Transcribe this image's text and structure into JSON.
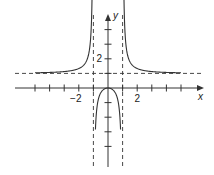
{
  "chart_data": {
    "type": "line",
    "title": "",
    "function": "y = x^2 / (x^2 - 1)",
    "xlabel": "x",
    "ylabel": "y",
    "x_tick_labels": [
      {
        "value": -2,
        "label": "−2"
      },
      {
        "value": 2,
        "label": "2"
      }
    ],
    "y_tick_labels": [
      {
        "value": 2,
        "label": "2"
      }
    ],
    "x_ticks": [
      -5,
      -4,
      -3,
      -2,
      -1,
      1,
      2,
      3,
      4,
      5
    ],
    "y_ticks": [
      -4,
      -3,
      -2,
      -1,
      1,
      2,
      3,
      4
    ],
    "xlim": [
      -6.5,
      6.5
    ],
    "ylim": [
      -5.4,
      5.0
    ],
    "grid": false,
    "asymptotes": {
      "vertical": [
        -1,
        1
      ],
      "horizontal": [
        1
      ]
    },
    "series": [
      {
        "name": "left branch",
        "x": [
          -5,
          -4,
          -3,
          -2,
          -1.5,
          -1.2,
          -1.1
        ],
        "y": [
          1.04,
          1.07,
          1.13,
          1.33,
          1.8,
          3.27,
          5.76
        ]
      },
      {
        "name": "middle branch",
        "x": [
          -0.88,
          -0.75,
          -0.5,
          0,
          0.5,
          0.75,
          0.88
        ],
        "y": [
          -3.44,
          -1.29,
          -0.33,
          0,
          -0.33,
          -1.29,
          -3.44
        ]
      },
      {
        "name": "right branch",
        "x": [
          1.1,
          1.2,
          1.5,
          2,
          3,
          4,
          5
        ],
        "y": [
          5.76,
          3.27,
          1.8,
          1.33,
          1.13,
          1.07,
          1.04
        ]
      }
    ]
  }
}
